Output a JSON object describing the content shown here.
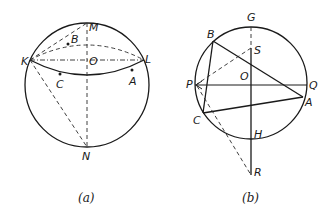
{
  "figure_a": {
    "caption": "(a)",
    "labels": {
      "M": "M",
      "B": "B",
      "K": "K",
      "O": "O",
      "L": "L",
      "C": "C",
      "A": "A",
      "N": "N"
    }
  },
  "figure_b": {
    "caption": "(b)",
    "labels": {
      "G": "G",
      "B": "B",
      "S": "S",
      "O": "O",
      "P": "P",
      "Q": "Q",
      "A": "A",
      "C": "C",
      "H": "H",
      "R": "R"
    }
  }
}
